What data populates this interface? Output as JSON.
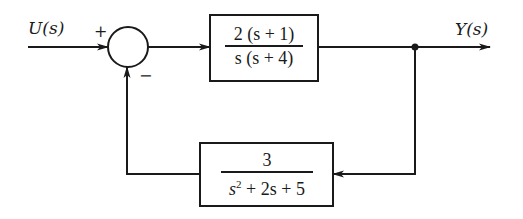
{
  "diagram": {
    "type": "feedback-control-block-diagram",
    "input_label": "U(s)",
    "output_label": "Y(s)",
    "summing_junction": {
      "top_sign": "+",
      "bottom_sign": "−"
    },
    "forward_block": {
      "numerator": "2 (s + 1)",
      "denominator": "s (s + 4)"
    },
    "feedback_block": {
      "numerator": "3",
      "denominator_base": "s",
      "denominator_exp": "2",
      "denominator_rest": " + 2s + 5"
    },
    "colors": {
      "stroke": "#1a1a1a",
      "background": "#ffffff"
    }
  }
}
